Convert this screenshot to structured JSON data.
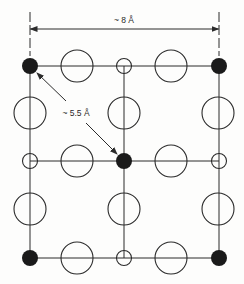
{
  "diagram": {
    "labels": {
      "lattice_width": "~ 8 Å",
      "diagonal_distance": "~ 5.5 Å"
    },
    "colors": {
      "line": "#2b2b2b",
      "dark_atom": "#1a1a1a",
      "background": "#fdfdfc"
    },
    "dimension": {
      "x1": 30,
      "x2": 219,
      "y": 29,
      "ext_top": 12
    },
    "grid": {
      "columns_x": [
        30,
        124,
        219
      ],
      "rows_y": [
        66,
        113,
        161,
        209,
        258
      ],
      "horizontal_lines_y": [
        66,
        161,
        258
      ]
    },
    "atoms": {
      "dark": [
        {
          "x": 30,
          "y": 66
        },
        {
          "x": 219,
          "y": 66
        },
        {
          "x": 124,
          "y": 161
        },
        {
          "x": 30,
          "y": 258
        },
        {
          "x": 219,
          "y": 258
        }
      ],
      "small_open": [
        {
          "x": 124,
          "y": 66
        },
        {
          "x": 30,
          "y": 161
        },
        {
          "x": 219,
          "y": 161
        },
        {
          "x": 124,
          "y": 258
        }
      ],
      "large_open": [
        {
          "x": 77,
          "y": 66
        },
        {
          "x": 171,
          "y": 66
        },
        {
          "x": 30,
          "y": 113
        },
        {
          "x": 124,
          "y": 113
        },
        {
          "x": 218,
          "y": 113
        },
        {
          "x": 77,
          "y": 161
        },
        {
          "x": 171,
          "y": 161
        },
        {
          "x": 30,
          "y": 209
        },
        {
          "x": 124,
          "y": 209
        },
        {
          "x": 218,
          "y": 209
        },
        {
          "x": 77,
          "y": 258
        },
        {
          "x": 171,
          "y": 258
        }
      ]
    }
  }
}
